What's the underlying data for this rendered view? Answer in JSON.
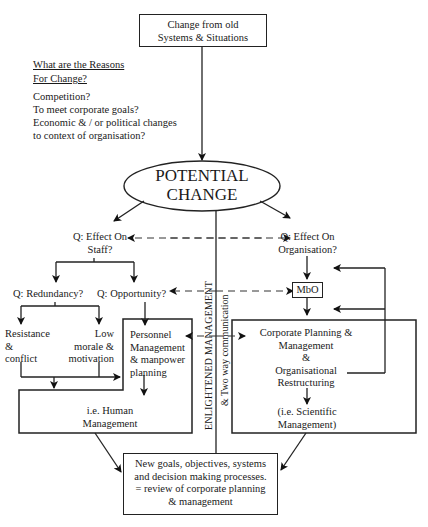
{
  "diagram": {
    "top_box": {
      "lines": [
        "Change from old",
        "Systems & Situations"
      ]
    },
    "reasons": {
      "heading": [
        "What are the Reasons",
        "For Change?"
      ],
      "items": [
        "Competition?",
        "To meet corporate goals?",
        "Economic & / or political changes",
        "to context of organisation?"
      ]
    },
    "ellipse": {
      "lines": [
        "POTENTIAL",
        "CHANGE"
      ]
    },
    "left_branch": {
      "question": [
        "Q: Effect On",
        "Staff?"
      ],
      "redundancy": "Q: Redundancy?",
      "opportunity": "Q: Opportunity?",
      "resistance": [
        "Resistance",
        "&",
        "conflict"
      ],
      "low_morale": [
        "Low",
        "morale &",
        "motivation"
      ],
      "personnel": [
        "Personnel",
        "Management",
        "& manpower",
        "planning"
      ],
      "human_mgmt": [
        "i.e. Human",
        "Management"
      ]
    },
    "right_branch": {
      "question": [
        "Q: Effect On",
        "Organisation?"
      ],
      "mbo": "MbO",
      "corporate": [
        "Corporate Planning &",
        "Management",
        "&",
        "Organisational",
        "Restructuring"
      ],
      "scientific": [
        "(i.e. Scientific",
        "Management)"
      ]
    },
    "center_spine": {
      "label1": "ENLIGHTENED MANAGEMENT",
      "label2": "& Two way communication"
    },
    "bottom_box": {
      "lines": [
        "New goals, objectives, systems",
        "and decision making processes.",
        "= review of corporate planning",
        "& management"
      ]
    }
  }
}
